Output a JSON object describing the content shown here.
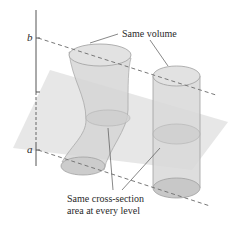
{
  "figure": {
    "axis_labels": {
      "top": "b",
      "bottom": "a"
    },
    "annotations": {
      "top": "Same volume",
      "bottom_line1": "Same cross-section",
      "bottom_line2": "area at every level"
    },
    "colors": {
      "axis": "#555555",
      "dashed": "#777777",
      "plane": "#e6e6e6",
      "solid_fill": "#d4d4d4",
      "solid_stroke": "#9a9a9a",
      "text": "#2a2a2a"
    }
  }
}
